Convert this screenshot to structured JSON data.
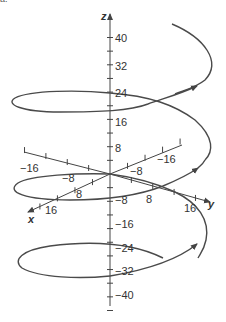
{
  "figure": {
    "corner_label": "a.",
    "axes": {
      "x": {
        "label": "x",
        "ticks": [
          {
            "value": -16,
            "text": "−16"
          },
          {
            "value": -8,
            "text": "−8"
          },
          {
            "value": 8,
            "text": "8"
          },
          {
            "value": 16,
            "text": "16"
          }
        ]
      },
      "y": {
        "label": "y",
        "ticks": [
          {
            "value": -16,
            "text": "−16"
          },
          {
            "value": -8,
            "text": "−8"
          },
          {
            "value": 8,
            "text": "8"
          },
          {
            "value": 16,
            "text": "16"
          }
        ]
      },
      "z": {
        "label": "z",
        "ticks": [
          {
            "value": 40,
            "text": "40"
          },
          {
            "value": 32,
            "text": "32"
          },
          {
            "value": 24,
            "text": "24"
          },
          {
            "value": 16,
            "text": "16"
          },
          {
            "value": 8,
            "text": "8"
          },
          {
            "value": -8,
            "text": "−8"
          },
          {
            "value": -16,
            "text": "−16"
          },
          {
            "value": -24,
            "text": "−24"
          },
          {
            "value": -32,
            "text": "−32"
          },
          {
            "value": -40,
            "text": "−40"
          }
        ]
      }
    },
    "curve": {
      "description": "helix spiraling upward along the z-axis with direction arrows",
      "color": "#4a4a4a",
      "z_range": [
        -30,
        44
      ]
    },
    "colors": {
      "axis": "#444444",
      "curve": "#4a4a4a",
      "text": "#333333"
    }
  }
}
